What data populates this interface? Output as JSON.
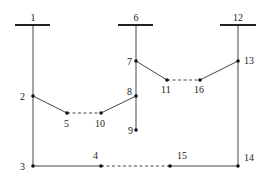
{
  "diagram": {
    "type": "distribution network / feeder topology",
    "colors": {
      "line": "#444444",
      "node": "#111111",
      "background": "#ffffff"
    },
    "buses": [
      {
        "id": "1",
        "label": "1",
        "x": 33,
        "bar_x1": 15,
        "bar_x2": 50,
        "y": 25
      },
      {
        "id": "6",
        "label": "6",
        "x": 136,
        "bar_x1": 118,
        "bar_x2": 153,
        "y": 25
      },
      {
        "id": "12",
        "label": "12",
        "x": 238,
        "bar_x1": 220,
        "bar_x2": 256,
        "y": 25
      }
    ],
    "nodes": [
      {
        "id": "2",
        "label": "2",
        "x": 33,
        "y": 96,
        "lx": 20,
        "ly": 100
      },
      {
        "id": "3",
        "label": "3",
        "x": 33,
        "y": 166,
        "lx": 20,
        "ly": 170
      },
      {
        "id": "4",
        "label": "4",
        "x": 101,
        "y": 166,
        "lx": 93,
        "ly": 159
      },
      {
        "id": "5",
        "label": "5",
        "x": 67,
        "y": 113,
        "lx": 64,
        "ly": 127
      },
      {
        "id": "7",
        "label": "7",
        "x": 136,
        "y": 61,
        "lx": 127,
        "ly": 65
      },
      {
        "id": "8",
        "label": "8",
        "x": 136,
        "y": 96,
        "lx": 127,
        "ly": 95
      },
      {
        "id": "9",
        "label": "9",
        "x": 136,
        "y": 130,
        "lx": 128,
        "ly": 134
      },
      {
        "id": "10",
        "label": "10",
        "x": 101,
        "y": 113,
        "lx": 95,
        "ly": 127
      },
      {
        "id": "11",
        "label": "11",
        "x": 167,
        "y": 80,
        "lx": 161,
        "ly": 93
      },
      {
        "id": "13",
        "label": "13",
        "x": 238,
        "y": 61,
        "lx": 244,
        "ly": 64
      },
      {
        "id": "14",
        "label": "14",
        "x": 238,
        "y": 166,
        "lx": 244,
        "ly": 161
      },
      {
        "id": "15",
        "label": "15",
        "x": 170,
        "y": 166,
        "lx": 177,
        "ly": 159
      },
      {
        "id": "16",
        "label": "16",
        "x": 200,
        "y": 80,
        "lx": 194,
        "ly": 93
      }
    ],
    "edges": [
      {
        "from": "1",
        "to": "2",
        "style": "solid"
      },
      {
        "from": "2",
        "to": "3",
        "style": "solid"
      },
      {
        "from": "3",
        "to": "4",
        "style": "solid"
      },
      {
        "from": "2",
        "to": "5",
        "style": "solid"
      },
      {
        "from": "5",
        "to": "10",
        "style": "dashed"
      },
      {
        "from": "10",
        "to": "8",
        "style": "solid"
      },
      {
        "from": "6",
        "to": "7",
        "style": "solid"
      },
      {
        "from": "7",
        "to": "8",
        "style": "solid"
      },
      {
        "from": "8",
        "to": "9",
        "style": "solid"
      },
      {
        "from": "7",
        "to": "11",
        "style": "solid"
      },
      {
        "from": "11",
        "to": "16",
        "style": "dashed"
      },
      {
        "from": "16",
        "to": "13",
        "style": "solid"
      },
      {
        "from": "12",
        "to": "13",
        "style": "solid"
      },
      {
        "from": "13",
        "to": "14",
        "style": "solid"
      },
      {
        "from": "4",
        "to": "15",
        "style": "dashed"
      },
      {
        "from": "15",
        "to": "14",
        "style": "solid"
      }
    ]
  }
}
